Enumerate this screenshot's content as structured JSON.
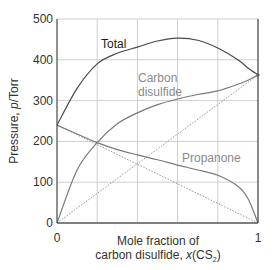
{
  "chart_data": {
    "type": "line",
    "title": "",
    "xlabel_line1": "Mole fraction of",
    "xlabel_line2_prefix": "carbon disulfide, ",
    "xlabel_var": "x",
    "xlabel_species": "(CS",
    "xlabel_sub": "2",
    "xlabel_close": ")",
    "ylabel_prefix": "Pressure, ",
    "ylabel_var": "p",
    "ylabel_unit": "/Torr",
    "xlim": [
      0,
      1
    ],
    "ylim": [
      0,
      500
    ],
    "x_ticks": [
      "0",
      "1"
    ],
    "y_ticks": [
      "0",
      "100",
      "200",
      "300",
      "400",
      "500"
    ],
    "grid": true,
    "x": [
      0,
      0.1,
      0.2,
      0.3,
      0.4,
      0.5,
      0.6,
      0.7,
      0.8,
      0.9,
      0.95,
      1.0
    ],
    "series": [
      {
        "name": "Total",
        "label": "Total",
        "values": [
          240,
          330,
          390,
          416,
          431,
          446,
          453,
          448,
          429,
          400,
          380,
          363
        ]
      },
      {
        "name": "Carbon disulfide",
        "label_line1": "Carbon",
        "label_line2": "disulfide",
        "values": [
          0,
          130,
          197,
          243,
          270,
          290,
          304,
          315,
          324,
          340,
          350,
          363
        ]
      },
      {
        "name": "Propanone",
        "label": "Propanone",
        "values": [
          240,
          218,
          197,
          180,
          167,
          155,
          142,
          130,
          117,
          90,
          60,
          0
        ]
      }
    ],
    "ideal_lines": [
      {
        "name": "Raoult CS2 (dotted)",
        "from": [
          0,
          0
        ],
        "to": [
          1,
          363
        ]
      },
      {
        "name": "Raoult propanone (dotted)",
        "from": [
          0,
          240
        ],
        "to": [
          1,
          0
        ]
      }
    ],
    "colors": {
      "total": "#4a4a4a",
      "cs2": "#7a7a7a",
      "propanone": "#7a7a7a",
      "label_gray": "#8a8a8a",
      "grid": "#cfcfcf",
      "axis": "#555555"
    }
  }
}
